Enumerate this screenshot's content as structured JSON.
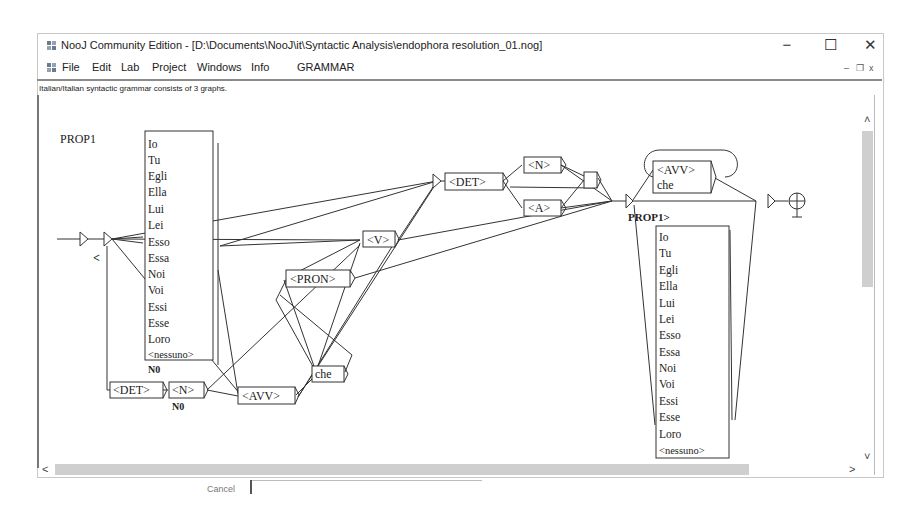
{
  "window": {
    "title": "NooJ Community Edition - [D:\\Documents\\NooJ\\it\\Syntactic Analysis\\endophora resolution_01.nog]",
    "controls": {
      "minimize": "−",
      "maximize": "☐",
      "close": "✕"
    },
    "mdi_controls": {
      "minimize": "–",
      "restore": "❐",
      "close": "x"
    }
  },
  "menu": {
    "items": [
      {
        "label": "File"
      },
      {
        "label": "Edit"
      },
      {
        "label": "Lab"
      },
      {
        "label": "Project"
      },
      {
        "label": "Windows"
      },
      {
        "label": "Info"
      },
      {
        "label": "GRAMMAR"
      }
    ]
  },
  "status": {
    "text": "Italian/Italian syntactic grammar consists of 3 graphs."
  },
  "graph": {
    "name": "PROP1",
    "labels": {
      "open_bracket": "<",
      "close_label": "PROP1>",
      "n0_under_list": "N0",
      "n0_under_n": "N0"
    },
    "pronoun_list_left": [
      "Io",
      "Tu",
      "Egli",
      "Ella",
      "Lui",
      "Lei",
      "Esso",
      "Essa",
      "Noi",
      "Voi",
      "Essi",
      "Esse",
      "Loro",
      "<nessuno>"
    ],
    "pronoun_list_right": [
      "Io",
      "Tu",
      "Egli",
      "Ella",
      "Lui",
      "Lei",
      "Esso",
      "Essa",
      "Noi",
      "Voi",
      "Essi",
      "Esse",
      "Loro",
      "<nessuno>"
    ],
    "nodes": {
      "det_top": "<DET>",
      "n_top": "<N>",
      "a_top": "<A>",
      "v": "<V>",
      "pron": "<PRON>",
      "che": "che",
      "det_bottom": "<DET>",
      "n_bottom": "<N>",
      "avv": "<AVV>",
      "avv_loop_line1": "<AVV>",
      "avv_loop_line2": "che"
    }
  },
  "scrollbars": {
    "up": "˄",
    "down": "˅",
    "left": "<",
    "right": ">"
  },
  "footer": {
    "cancel_label": "Cancel"
  },
  "colors": {
    "line": "#333333",
    "thumb": "#cfcfcf",
    "border": "#8a8a8a"
  }
}
